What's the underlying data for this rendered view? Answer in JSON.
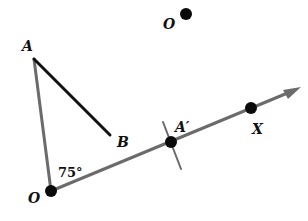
{
  "diagram": {
    "labels": {
      "A": "A",
      "B": "B",
      "O": "O",
      "angle": "75°",
      "A_prime": "A′",
      "X": "X",
      "O_new": "O"
    },
    "colors": {
      "ray_gray": "#6b6b6b",
      "segment_black": "#111111",
      "point_black": "#0a0a0a"
    },
    "angle_measure_degrees": 75
  }
}
